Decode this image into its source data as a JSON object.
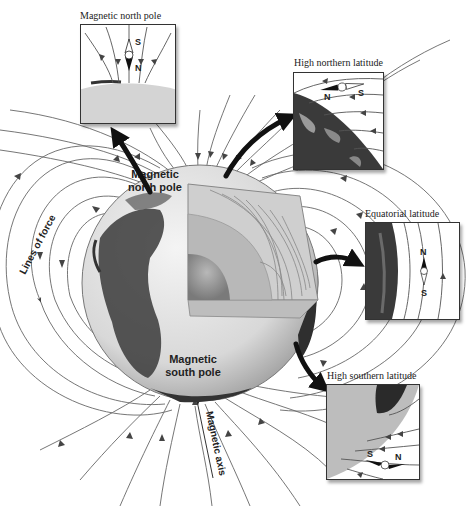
{
  "figure": {
    "main_labels": {
      "north_pole": [
        "Magnetic",
        "north pole"
      ],
      "south_pole": [
        "Magnetic",
        "south pole"
      ],
      "lines_of_force": "Lines of force",
      "magnetic_axis": "Magnetic axis"
    },
    "insets": [
      {
        "id": "magnetic-north-pole",
        "caption": "Magnetic north pole",
        "compass_top": "S",
        "compass_bottom": "N",
        "compass_orientation": "vertical, pointing down"
      },
      {
        "id": "high-northern-latitude",
        "caption": "High northern latitude",
        "compass_left": "N",
        "compass_right": "S",
        "compass_orientation": "tilted, pointing down-left"
      },
      {
        "id": "equatorial-latitude",
        "caption": "Equatorial latitude",
        "compass_top": "N",
        "compass_bottom": "S",
        "compass_orientation": "horizontal to surface, pointing north"
      },
      {
        "id": "high-southern-latitude",
        "caption": "High southern latitude",
        "compass_left": "S",
        "compass_right": "N",
        "compass_orientation": "tilted, pointing up"
      }
    ],
    "colors": {
      "field_line": "#555555",
      "arrow": "#111111",
      "core_inner": "#a8a8a8",
      "core_outer": "#c4c4c4",
      "mantle": "#d6d6d6",
      "ocean": "#e6e6e6",
      "land": "#3a3a3a"
    }
  }
}
